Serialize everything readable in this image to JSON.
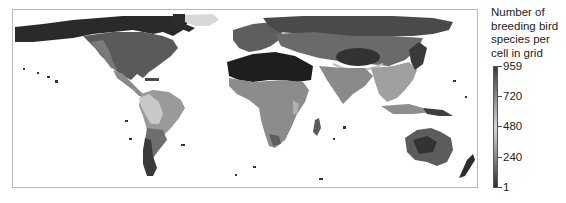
{
  "figure": {
    "type": "choropleth world map"
  },
  "legend": {
    "title_lines": [
      "Number of",
      "breeding bird",
      "species per",
      "cell in grid"
    ],
    "ticks": [
      {
        "value": "959",
        "y": 66
      },
      {
        "value": "720",
        "y": 96
      },
      {
        "value": "480",
        "y": 126
      },
      {
        "value": "240",
        "y": 157
      },
      {
        "value": "1",
        "y": 187
      }
    ],
    "min": 1,
    "max": 959
  },
  "colors": {
    "low": "#2e2e2e",
    "mid": "#d6d6d6",
    "high": "#3c3c3c",
    "ocean": "#ffffff",
    "frame": "#b8b8b8"
  },
  "regions": [
    {
      "name": "arctic-north-america",
      "fill": "#2a2a2a"
    },
    {
      "name": "north-america",
      "fill": "#5a5a5a"
    },
    {
      "name": "central-america",
      "fill": "#8a8a8a"
    },
    {
      "name": "south-america-andes",
      "fill": "#c8c8c8"
    },
    {
      "name": "amazon",
      "fill": "#9a9a9a"
    },
    {
      "name": "patagonia",
      "fill": "#3a3a3a"
    },
    {
      "name": "greenland",
      "fill": "#d8d8d8"
    },
    {
      "name": "europe",
      "fill": "#5e5e5e"
    },
    {
      "name": "siberia",
      "fill": "#4a4a4a"
    },
    {
      "name": "sahara-arabia",
      "fill": "#1e1e1e"
    },
    {
      "name": "africa-sub-saharan",
      "fill": "#8c8c8c"
    },
    {
      "name": "madagascar",
      "fill": "#5a5a5a"
    },
    {
      "name": "central-asia",
      "fill": "#6a6a6a"
    },
    {
      "name": "tibet",
      "fill": "#333333"
    },
    {
      "name": "south-asia",
      "fill": "#8a8a8a"
    },
    {
      "name": "southeast-asia",
      "fill": "#a0a0a0"
    },
    {
      "name": "australia",
      "fill": "#5c5c5c"
    },
    {
      "name": "new-zealand",
      "fill": "#2c2c2c"
    }
  ]
}
